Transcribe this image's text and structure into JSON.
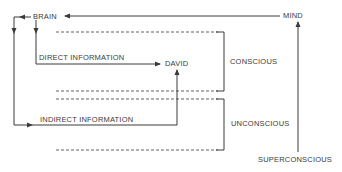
{
  "diagram": {
    "nodes": {
      "brain": "BRAIN",
      "mind": "MIND",
      "david": "DAVID",
      "conscious": "CONSCIOUS",
      "unconscious": "UNCONSCIOUS",
      "superconscious": "SUPERCONSCIOUS"
    },
    "edges": {
      "direct": "DIRECT INFORMATION",
      "indirect": "INDIRECT INFORMATION"
    },
    "colors": {
      "line": "#3a3a3a",
      "background": "#ffffff"
    }
  }
}
